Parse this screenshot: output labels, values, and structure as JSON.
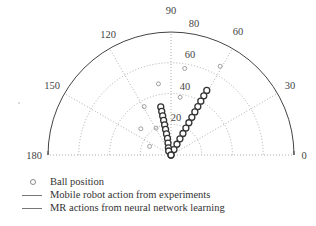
{
  "chart_data": {
    "type": "scatter",
    "subtype": "polar-half",
    "title": "",
    "angle_range_deg": [
      0,
      180
    ],
    "radius_range": [
      0,
      80
    ],
    "angle_ticks": [
      0,
      30,
      60,
      90,
      120,
      150,
      180
    ],
    "radial_ticks": [
      20,
      40,
      60,
      80
    ],
    "grid": true,
    "legend_position": "bottom-left",
    "series": [
      {
        "name": "Ball position",
        "marker": "open-circle",
        "points": [
          {
            "theta": 81,
            "r": 57
          },
          {
            "theta": 61,
            "r": 66
          },
          {
            "theta": 100,
            "r": 47
          },
          {
            "theta": 119,
            "r": 36
          },
          {
            "theta": 139,
            "r": 26
          },
          {
            "theta": 158,
            "r": 15
          },
          {
            "theta": 81,
            "r": 38
          },
          {
            "theta": 119,
            "r": 20
          }
        ]
      },
      {
        "name": "Mobile robot action from experiments",
        "marker": "line",
        "points": [
          {
            "theta": 61,
            "r": 48
          },
          {
            "theta": 61,
            "r": 44
          },
          {
            "theta": 61,
            "r": 40
          },
          {
            "theta": 61,
            "r": 36
          },
          {
            "theta": 61,
            "r": 32
          },
          {
            "theta": 61,
            "r": 28
          },
          {
            "theta": 61,
            "r": 24
          },
          {
            "theta": 61,
            "r": 20
          },
          {
            "theta": 61,
            "r": 16
          },
          {
            "theta": 61,
            "r": 12
          },
          {
            "theta": 61,
            "r": 8
          },
          {
            "theta": 61,
            "r": 4
          },
          {
            "theta": 90,
            "r": 0
          }
        ]
      },
      {
        "name": "MR actions from neural network learning",
        "marker": "line",
        "points": [
          {
            "theta": 102,
            "r": 32
          },
          {
            "theta": 102,
            "r": 29
          },
          {
            "theta": 102,
            "r": 26
          },
          {
            "theta": 102,
            "r": 23
          },
          {
            "theta": 102,
            "r": 20
          },
          {
            "theta": 102,
            "r": 17
          },
          {
            "theta": 102,
            "r": 14
          },
          {
            "theta": 102,
            "r": 11
          },
          {
            "theta": 104,
            "r": 8
          },
          {
            "theta": 110,
            "r": 5
          },
          {
            "theta": 120,
            "r": 3
          },
          {
            "theta": 90,
            "r": 0
          }
        ]
      }
    ]
  },
  "labels": {
    "angle": {
      "a0": "0",
      "a30": "30",
      "a60": "60",
      "a90": "90",
      "a120": "120",
      "a150": "150",
      "a180": "180"
    },
    "radial": {
      "r20": "20",
      "r40": "40",
      "r60": "60",
      "r80": "80"
    }
  },
  "legend": {
    "items": [
      {
        "label": "Ball position"
      },
      {
        "label": "Mobile robot action from experiments"
      },
      {
        "label": "MR actions from neural network learning"
      }
    ]
  }
}
